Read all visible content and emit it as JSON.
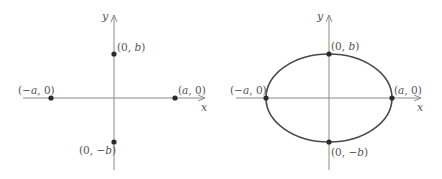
{
  "panels": [
    {
      "id": "left",
      "description": "Intercept points on axes",
      "axes": {
        "x_label": "x",
        "y_label": "y"
      },
      "points": [
        {
          "name": "neg-a",
          "label": "(−a, 0)"
        },
        {
          "name": "pos-a",
          "label": "(a, 0)"
        },
        {
          "name": "pos-b",
          "label": "(0, b)"
        },
        {
          "name": "neg-b",
          "label": "(0, −b)"
        }
      ],
      "has_ellipse": false
    },
    {
      "id": "right",
      "description": "Ellipse through intercept points",
      "axes": {
        "x_label": "x",
        "y_label": "y"
      },
      "points": [
        {
          "name": "neg-a",
          "label": "(−a, 0)"
        },
        {
          "name": "pos-a",
          "label": "(a, 0)"
        },
        {
          "name": "pos-b",
          "label": "(0, b)"
        },
        {
          "name": "neg-b",
          "label": "(0, −b)"
        }
      ],
      "has_ellipse": true
    }
  ],
  "colors": {
    "axis": "#8a8a8a",
    "curve": "#4a4a4a",
    "point": "#2b2b2b",
    "text": "#555555"
  }
}
